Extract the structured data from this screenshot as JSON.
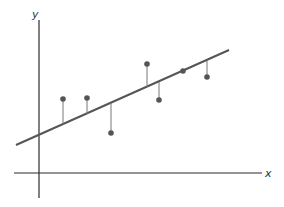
{
  "diagram": {
    "title": "",
    "type": "least-squares regression with residuals",
    "colors": {
      "axis": "#2a2a2a",
      "line": "#555555",
      "point": "#555555",
      "residual": "#777777",
      "background": "#ffffff"
    },
    "axes": {
      "x_label": "x",
      "y_label": "y",
      "x_axis": {
        "x1": 14,
        "y1": 173,
        "x2": 262,
        "y2": 173
      },
      "y_axis": {
        "x1": 39,
        "y1": 20,
        "x2": 39,
        "y2": 198
      }
    },
    "regression_line": {
      "x1": 16,
      "y1": 145,
      "x2": 229,
      "y2": 50
    },
    "points": [
      {
        "x": 63,
        "y": 99,
        "line_y": 124
      },
      {
        "x": 87,
        "y": 98,
        "line_y": 114
      },
      {
        "x": 111,
        "y": 133,
        "line_y": 103
      },
      {
        "x": 147,
        "y": 64,
        "line_y": 87
      },
      {
        "x": 159,
        "y": 100,
        "line_y": 82
      },
      {
        "x": 183,
        "y": 71,
        "line_y": 71
      },
      {
        "x": 207,
        "y": 77,
        "line_y": 61
      }
    ]
  }
}
